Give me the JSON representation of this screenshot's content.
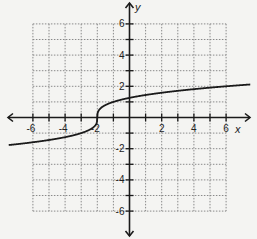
{
  "chart_data": {
    "type": "line",
    "title": "",
    "function": "y = cbrt(x + 2)",
    "xlabel": "x",
    "ylabel": "y",
    "xlim": [
      -6,
      6
    ],
    "ylim": [
      -6,
      6
    ],
    "grid": true,
    "grid_step": 1,
    "x_tick_labels": [
      "-6",
      "-4",
      "-2",
      "2",
      "4",
      "6"
    ],
    "y_tick_labels": [
      "6",
      "4",
      "2",
      "-2",
      "-4",
      "-6"
    ],
    "series": [
      {
        "name": "curve",
        "x": [
          -7.5,
          -6,
          -4,
          -3,
          -2.5,
          -2,
          -1.5,
          -1,
          0,
          2,
          4,
          6,
          7.5
        ],
        "y": [
          -1.71,
          -1.59,
          -1.26,
          -1.0,
          -0.79,
          0,
          0.79,
          1.0,
          1.26,
          1.59,
          1.82,
          2.0,
          2.12
        ]
      }
    ],
    "colors": {
      "curve": "#1a1a1a",
      "grid": "#8a8a8a",
      "axes": "#1a1a1a",
      "background": "#f4f4f2"
    }
  }
}
